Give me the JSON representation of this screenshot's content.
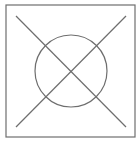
{
  "diagram": {
    "colors": {
      "background": "#ffffff",
      "stroke": "#6e6e6e"
    },
    "frame": {
      "x": 6,
      "y": 5,
      "width": 129,
      "height": 132
    },
    "circle": {
      "cx": 71,
      "cy": 71,
      "r": 36
    },
    "lines": [
      {
        "x1": 16,
        "y1": 16,
        "x2": 126,
        "y2": 127
      },
      {
        "x1": 126,
        "y1": 16,
        "x2": 16,
        "y2": 127
      }
    ]
  }
}
